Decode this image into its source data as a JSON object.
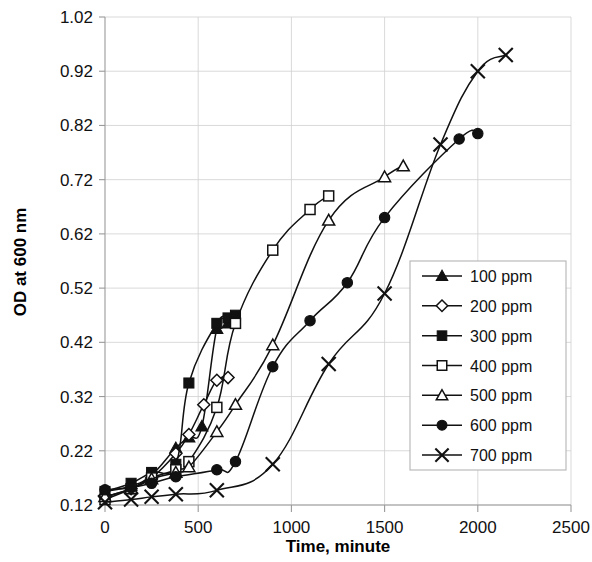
{
  "chart_data": {
    "type": "line",
    "title": "",
    "xlabel": "Time, minute",
    "ylabel": "OD at 600 nm",
    "xlim": [
      0,
      2500
    ],
    "ylim": [
      0.12,
      1.02
    ],
    "xticks": [
      0,
      500,
      1000,
      1500,
      2000,
      2500
    ],
    "yticks": [
      0.12,
      0.22,
      0.32,
      0.42,
      0.52,
      0.62,
      0.72,
      0.82,
      0.92,
      1.02
    ],
    "xtick_labels": [
      "0",
      "500",
      "1000",
      "1500",
      "2000",
      "2500"
    ],
    "ytick_labels": [
      "0.12",
      "0.22",
      "0.32",
      "0.42",
      "0.52",
      "0.62",
      "0.72",
      "0.82",
      "0.92",
      "1.02"
    ],
    "grid": true,
    "legend_position": "right-inside",
    "series": [
      {
        "name": "100 ppm",
        "marker": "filled-triangle",
        "color": "#111111",
        "x": [
          0,
          140,
          250,
          380,
          450,
          520,
          600,
          660
        ],
        "y": [
          0.145,
          0.155,
          0.175,
          0.225,
          0.245,
          0.265,
          0.445,
          0.455
        ]
      },
      {
        "name": "200 ppm",
        "marker": "open-diamond",
        "color": "#111111",
        "x": [
          0,
          140,
          250,
          380,
          450,
          530,
          600,
          660
        ],
        "y": [
          0.135,
          0.15,
          0.17,
          0.215,
          0.25,
          0.305,
          0.35,
          0.355
        ]
      },
      {
        "name": "300 ppm",
        "marker": "filled-square",
        "color": "#111111",
        "x": [
          0,
          140,
          250,
          380,
          450,
          600,
          660,
          700
        ],
        "y": [
          0.145,
          0.16,
          0.18,
          0.195,
          0.345,
          0.455,
          0.465,
          0.47
        ]
      },
      {
        "name": "400 ppm",
        "marker": "open-square",
        "color": "#111111",
        "x": [
          0,
          140,
          250,
          380,
          450,
          600,
          700,
          900,
          1100,
          1200
        ],
        "y": [
          0.13,
          0.15,
          0.17,
          0.185,
          0.2,
          0.3,
          0.455,
          0.59,
          0.665,
          0.69
        ]
      },
      {
        "name": "500 ppm",
        "marker": "open-triangle",
        "color": "#111111",
        "x": [
          0,
          140,
          250,
          380,
          450,
          600,
          700,
          900,
          1200,
          1500,
          1600
        ],
        "y": [
          0.135,
          0.15,
          0.168,
          0.18,
          0.19,
          0.255,
          0.305,
          0.415,
          0.645,
          0.725,
          0.745
        ]
      },
      {
        "name": "600 ppm",
        "marker": "filled-circle",
        "color": "#111111",
        "x": [
          0,
          140,
          250,
          380,
          600,
          700,
          900,
          1100,
          1300,
          1500,
          1900,
          2000
        ],
        "y": [
          0.148,
          0.152,
          0.16,
          0.172,
          0.185,
          0.2,
          0.375,
          0.46,
          0.53,
          0.65,
          0.795,
          0.805
        ]
      },
      {
        "name": "700 ppm",
        "marker": "cross-x",
        "color": "#111111",
        "x": [
          0,
          140,
          250,
          380,
          600,
          900,
          1200,
          1500,
          1800,
          2000,
          2150
        ],
        "y": [
          0.125,
          0.13,
          0.135,
          0.14,
          0.147,
          0.195,
          0.38,
          0.51,
          0.785,
          0.92,
          0.95
        ]
      }
    ]
  },
  "legend": {
    "entries": [
      {
        "label": "100 ppm"
      },
      {
        "label": "200 ppm"
      },
      {
        "label": "300 ppm"
      },
      {
        "label": "400 ppm"
      },
      {
        "label": "500 ppm"
      },
      {
        "label": "600 ppm"
      },
      {
        "label": "700 ppm"
      }
    ]
  }
}
